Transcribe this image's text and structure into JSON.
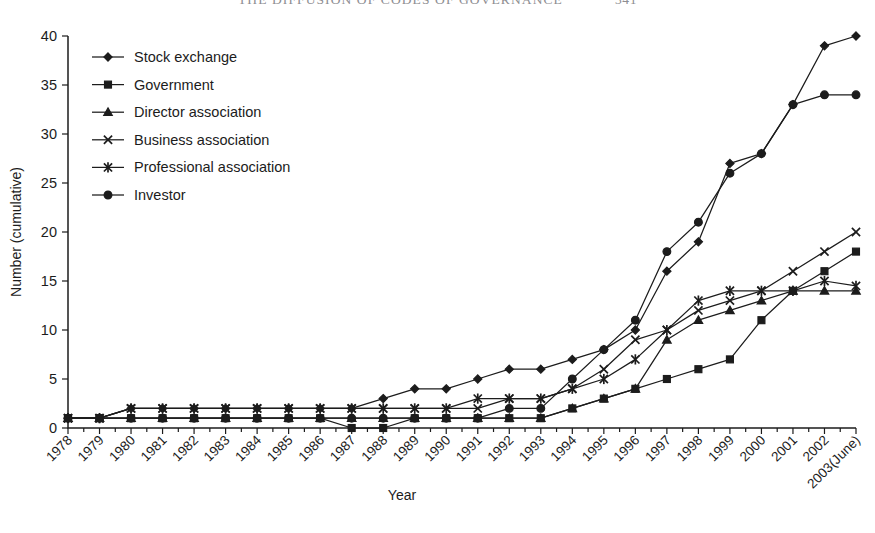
{
  "page": {
    "running_head": "THE DIFFUSION OF CODES OF GOVERNANCE",
    "page_number": "341"
  },
  "chart_data": {
    "type": "line",
    "title": "",
    "xlabel": "Year",
    "ylabel": "Number (cumulative)",
    "ylim": [
      0,
      40
    ],
    "ytick_labels": [
      "0",
      "5",
      "10",
      "15",
      "20",
      "25",
      "30",
      "35",
      "40"
    ],
    "ytick_values": [
      0,
      5,
      10,
      15,
      20,
      25,
      30,
      35,
      40
    ],
    "grid": false,
    "legend_position": "upper-left inside axes",
    "categories": [
      "1978",
      "1979",
      "1980",
      "1981",
      "1982",
      "1983",
      "1984",
      "1985",
      "1986",
      "1987",
      "1988",
      "1989",
      "1990",
      "1991",
      "1992",
      "1993",
      "1994",
      "1995",
      "1996",
      "1997",
      "1998",
      "1999",
      "2000",
      "2001",
      "2002",
      "2003(June)"
    ],
    "series": [
      {
        "name": "Stock exchange",
        "marker": "diamond",
        "values": [
          1,
          1,
          2,
          2,
          2,
          2,
          2,
          2,
          2,
          2,
          3,
          4,
          4,
          5,
          6,
          6,
          7,
          8,
          10,
          16,
          19,
          27,
          28,
          33,
          39,
          40
        ]
      },
      {
        "name": "Government",
        "marker": "square",
        "values": [
          1,
          1,
          1,
          1,
          1,
          1,
          1,
          1,
          1,
          0,
          0,
          1,
          1,
          1,
          1,
          1,
          2,
          3,
          4,
          5,
          6,
          7,
          11,
          14,
          16,
          18
        ]
      },
      {
        "name": "Director association",
        "marker": "triangle",
        "values": [
          1,
          1,
          1,
          1,
          1,
          1,
          1,
          1,
          1,
          1,
          1,
          1,
          1,
          1,
          1,
          1,
          2,
          3,
          4,
          9,
          11,
          12,
          13,
          14,
          14,
          14
        ]
      },
      {
        "name": "Business association",
        "marker": "cross",
        "values": [
          1,
          1,
          2,
          2,
          2,
          2,
          2,
          2,
          2,
          2,
          2,
          2,
          2,
          2,
          3,
          3,
          4,
          6,
          9,
          10,
          12,
          13,
          14,
          16,
          18,
          20
        ]
      },
      {
        "name": "Professional association",
        "marker": "asterisk",
        "values": [
          1,
          1,
          2,
          2,
          2,
          2,
          2,
          2,
          2,
          2,
          2,
          2,
          2,
          3,
          3,
          3,
          4,
          5,
          7,
          10,
          13,
          14,
          14,
          14,
          15,
          14.5
        ]
      },
      {
        "name": "Investor",
        "marker": "circle",
        "values": [
          1,
          1,
          1,
          1,
          1,
          1,
          1,
          1,
          1,
          1,
          1,
          1,
          1,
          1,
          2,
          2,
          5,
          8,
          11,
          18,
          21,
          26,
          28,
          33,
          34,
          34
        ]
      }
    ]
  },
  "colors": {
    "ink": "#1c1c1c",
    "running_head": "#8e8e92",
    "background": "#ffffff"
  }
}
